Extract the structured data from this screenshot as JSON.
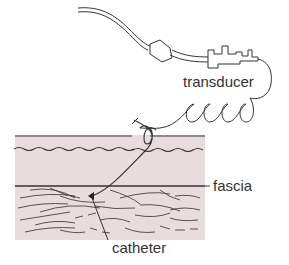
{
  "diagram": {
    "labels": {
      "transducer": "transducer",
      "fascia": "fascia",
      "catheter": "catheter"
    },
    "colors": {
      "skin": "#e8dcdc",
      "line": "#333333",
      "text": "#333333"
    }
  }
}
